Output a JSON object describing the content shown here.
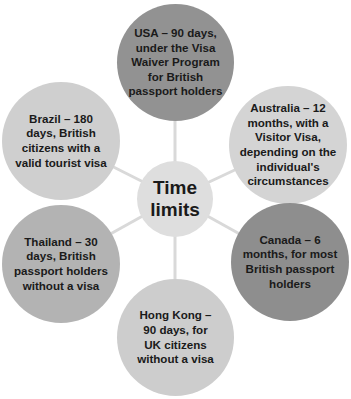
{
  "diagram": {
    "type": "radial-hub",
    "center": {
      "label": "Time limits",
      "lines": [
        "Time",
        "limits"
      ],
      "color": "#dedede"
    },
    "connector_color": "#d9d9d9",
    "nodes": [
      {
        "id": "usa",
        "position": "top",
        "lines": [
          "USA – 90 days,",
          "under the Visa",
          "Waiver Program",
          "for British",
          "passport holders"
        ],
        "color": "#929292"
      },
      {
        "id": "australia",
        "position": "upper-right",
        "lines": [
          "Australia – 12",
          "months, with a",
          "Visitor Visa,",
          "depending on the",
          "individual's",
          "circumstances"
        ],
        "color": "#d4d4d4"
      },
      {
        "id": "canada",
        "position": "lower-right",
        "lines": [
          "Canada – 6",
          "months, for most",
          "British passport",
          "holders"
        ],
        "color": "#8e8e8e"
      },
      {
        "id": "hong-kong",
        "position": "bottom",
        "lines": [
          "Hong Kong –",
          "90 days, for",
          "UK citizens",
          "without a visa"
        ],
        "color": "#cdcdcd"
      },
      {
        "id": "thailand",
        "position": "lower-left",
        "lines": [
          "Thailand – 30",
          "days, British",
          "passport holders",
          "without a visa"
        ],
        "color": "#b3b3b3"
      },
      {
        "id": "brazil",
        "position": "upper-left",
        "lines": [
          "Brazil – 180",
          "days, British",
          "citizens with a",
          "valid tourist visa"
        ],
        "color": "#cfcfcf"
      }
    ]
  }
}
